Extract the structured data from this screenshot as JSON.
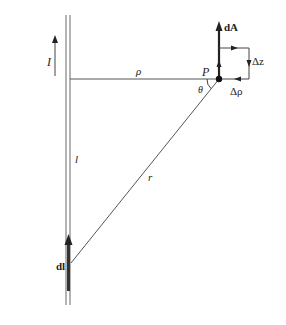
{
  "figure": {
    "labels": {
      "current": "I",
      "rho": "ρ",
      "point": "P",
      "theta": "θ",
      "dA": "dA",
      "delta_z": "Δz",
      "delta_rho": "Δρ",
      "l": "l",
      "r": "r",
      "dl": "dl"
    },
    "colors": {
      "line": "#555555",
      "thick": "#222222",
      "text": "#222222",
      "background": "#ffffff"
    },
    "elements": [
      "infinite straight wire (double line)",
      "current direction arrow I (upward)",
      "perpendicular distance rho from wire to point P",
      "point P with vector dA pointing upward",
      "rectangular loop of sides Δz and Δρ with circulation arrows",
      "line r from current element dl to point P, angle θ at P",
      "current element dl (thick upward arrow on wire)",
      "distance l along wire"
    ]
  }
}
